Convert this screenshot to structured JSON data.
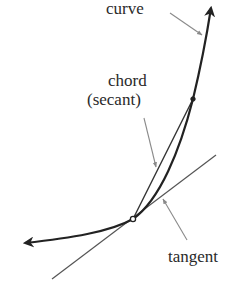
{
  "diagram": {
    "labels": {
      "curve": "curve",
      "chord_line1": "chord",
      "chord_line2": "(secant)",
      "tangent": "tangent"
    },
    "colors": {
      "curve": "#222222",
      "chord": "#333333",
      "tangent": "#555555",
      "pointer": "#8a8a8a",
      "text": "#2a2a2a",
      "background": "#ffffff"
    },
    "points": {
      "tangency": [
        133,
        219
      ],
      "secant_point": [
        193,
        99
      ],
      "curve_top_arrow": [
        212,
        5
      ],
      "curve_left_arrow": [
        23,
        243
      ]
    }
  }
}
